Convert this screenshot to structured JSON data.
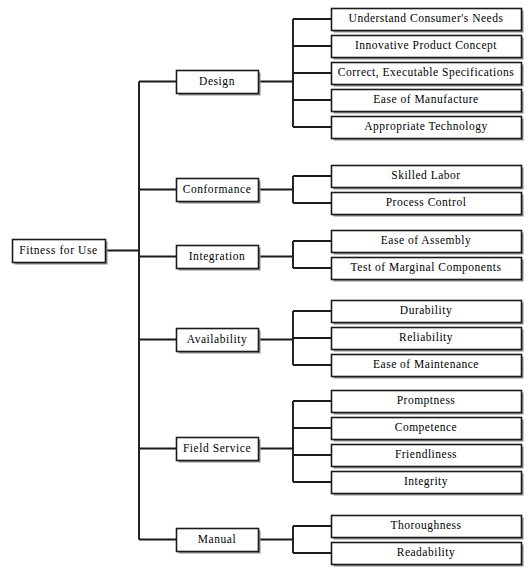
{
  "diagram": {
    "title": "Fitness for Use",
    "type": "tree",
    "orientation": "left-to-right",
    "style": {
      "line_color": "#1b1b1b",
      "box_fill": "#ffffff",
      "box_stroke": "#1b1b1b",
      "shadow_color": "#8e8e8e",
      "text_color": "#000000",
      "background": "#ffffff"
    },
    "root": {
      "label": "Fitness for Use",
      "x": 12,
      "y": 239,
      "w": 93,
      "h": 23
    },
    "branches": [
      {
        "label": "Design",
        "x": 176,
        "y": 70,
        "w": 82,
        "h": 23,
        "junction_x": 293,
        "leaves": [
          {
            "label": "Understand Consumer's Needs",
            "x": 331,
            "y": 8,
            "w": 190,
            "h": 22
          },
          {
            "label": "Innovative Product Concept",
            "x": 331,
            "y": 35,
            "w": 190,
            "h": 22
          },
          {
            "label": "Correct, Executable Specifications",
            "x": 331,
            "y": 62,
            "w": 190,
            "h": 22
          },
          {
            "label": "Ease of Manufacture",
            "x": 331,
            "y": 89,
            "w": 190,
            "h": 22
          },
          {
            "label": "Appropriate Technology",
            "x": 331,
            "y": 116,
            "w": 190,
            "h": 22
          }
        ]
      },
      {
        "label": "Conformance",
        "x": 176,
        "y": 178,
        "w": 82,
        "h": 23,
        "junction_x": 293,
        "leaves": [
          {
            "label": "Skilled Labor",
            "x": 331,
            "y": 165,
            "w": 190,
            "h": 22
          },
          {
            "label": "Process Control",
            "x": 331,
            "y": 192,
            "w": 190,
            "h": 22
          }
        ]
      },
      {
        "label": "Integration",
        "x": 176,
        "y": 245,
        "w": 82,
        "h": 23,
        "junction_x": 293,
        "leaves": [
          {
            "label": "Ease of Assembly",
            "x": 331,
            "y": 230,
            "w": 190,
            "h": 22
          },
          {
            "label": "Test of Marginal Components",
            "x": 331,
            "y": 257,
            "w": 190,
            "h": 22
          }
        ]
      },
      {
        "label": "Availability",
        "x": 176,
        "y": 328,
        "w": 82,
        "h": 23,
        "junction_x": 293,
        "leaves": [
          {
            "label": "Durability",
            "x": 331,
            "y": 300,
            "w": 190,
            "h": 22
          },
          {
            "label": "Reliability",
            "x": 331,
            "y": 327,
            "w": 190,
            "h": 22
          },
          {
            "label": "Ease of Maintenance",
            "x": 331,
            "y": 354,
            "w": 190,
            "h": 22
          }
        ]
      },
      {
        "label": "Field Service",
        "x": 176,
        "y": 437,
        "w": 82,
        "h": 23,
        "junction_x": 293,
        "leaves": [
          {
            "label": "Promptness",
            "x": 331,
            "y": 390,
            "w": 190,
            "h": 22
          },
          {
            "label": "Competence",
            "x": 331,
            "y": 417,
            "w": 190,
            "h": 22
          },
          {
            "label": "Friendliness",
            "x": 331,
            "y": 444,
            "w": 190,
            "h": 22
          },
          {
            "label": "Integrity",
            "x": 331,
            "y": 471,
            "w": 190,
            "h": 22
          }
        ]
      },
      {
        "label": "Manual",
        "x": 176,
        "y": 528,
        "w": 82,
        "h": 23,
        "junction_x": 293,
        "leaves": [
          {
            "label": "Thoroughness",
            "x": 331,
            "y": 515,
            "w": 190,
            "h": 22
          },
          {
            "label": "Readability",
            "x": 331,
            "y": 542,
            "w": 190,
            "h": 22
          }
        ]
      }
    ],
    "trunk_x": 139
  }
}
